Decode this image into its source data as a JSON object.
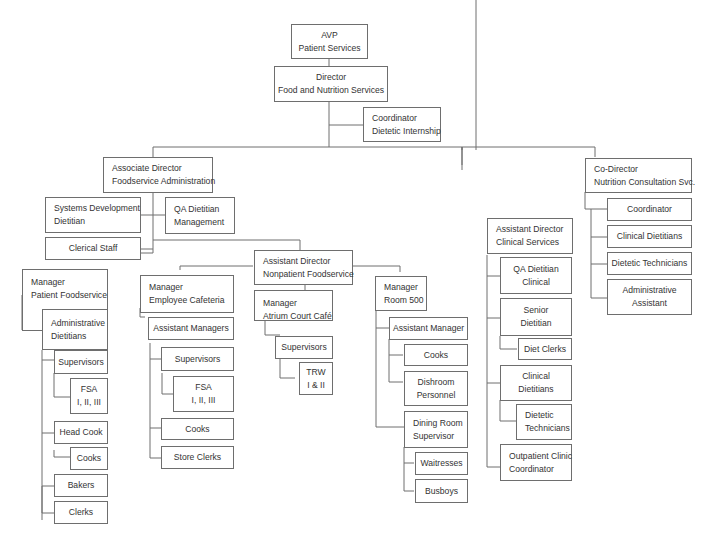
{
  "org_chart": {
    "avp": {
      "line1": "AVP",
      "line2": "Patient Services"
    },
    "director": {
      "line1": "Director",
      "line2": "Food and Nutrition Services"
    },
    "coordinator_internship": {
      "line1": "Coordinator",
      "line2": "Dietetic Internship"
    },
    "assoc_director": {
      "line1": "Associate Director",
      "line2": "Foodservice Administration"
    },
    "systems_dev": {
      "line1": "Systems Development",
      "line2": "Dietitian"
    },
    "qa_mgmt": {
      "line1": "QA Dietitian",
      "line2": "Management"
    },
    "clerical": {
      "line1": "Clerical Staff"
    },
    "mgr_patient": {
      "line1": "Manager",
      "line2": "Patient Foodservice"
    },
    "admin_dietitians": {
      "line1": "Administrative",
      "line2": "Dietitians"
    },
    "pf_supervisors": {
      "line1": "Supervisors"
    },
    "pf_fsa": {
      "line1": "FSA",
      "line2": "I, II, III"
    },
    "pf_head_cook": {
      "line1": "Head Cook"
    },
    "pf_cooks": {
      "line1": "Cooks"
    },
    "pf_bakers": {
      "line1": "Bakers"
    },
    "pf_clerks": {
      "line1": "Clerks"
    },
    "mgr_cafeteria": {
      "line1": "Manager",
      "line2": "Employee Cafeteria"
    },
    "ec_asst_mgrs": {
      "line1": "Assistant Managers"
    },
    "ec_supervisors": {
      "line1": "Supervisors"
    },
    "ec_fsa": {
      "line1": "FSA",
      "line2": "I, II, III"
    },
    "ec_cooks": {
      "line1": "Cooks"
    },
    "ec_store_clerks": {
      "line1": "Store Clerks"
    },
    "asst_dir_nonpatient": {
      "line1": "Assistant Director",
      "line2": "Nonpatient Foodservice"
    },
    "mgr_atrium": {
      "line1": "Manager",
      "line2": "Atrium Court Café"
    },
    "ac_supervisors": {
      "line1": "Supervisors"
    },
    "ac_trw": {
      "line1": "TRW",
      "line2": "I & II"
    },
    "mgr_room500": {
      "line1": "Manager",
      "line2": "Room 500"
    },
    "r5_asst_mgr": {
      "line1": "Assistant Manager"
    },
    "r5_cooks": {
      "line1": "Cooks"
    },
    "r5_dishroom": {
      "line1": "Dishroom",
      "line2": "Personnel"
    },
    "r5_dining_sup": {
      "line1": "Dining Room",
      "line2": "Supervisor"
    },
    "r5_waitresses": {
      "line1": "Waitresses"
    },
    "r5_busboys": {
      "line1": "Busboys"
    },
    "asst_dir_clinical": {
      "line1": "Assistant Director",
      "line2": "Clinical Services"
    },
    "cs_qa_clinical": {
      "line1": "QA Dietitian",
      "line2": "Clinical"
    },
    "cs_senior": {
      "line1": "Senior",
      "line2": "Dietitian"
    },
    "cs_diet_clerks": {
      "line1": "Diet Clerks"
    },
    "cs_clinical_dietitians": {
      "line1": "Clinical",
      "line2": "Dietitians"
    },
    "cs_dietetic_techs": {
      "line1": "Dietetic",
      "line2": "Technicians"
    },
    "cs_outpatient": {
      "line1": "Outpatient Clinic",
      "line2": "Coordinator"
    },
    "co_director": {
      "line1": "Co-Director",
      "line2": "Nutrition Consultation Svc."
    },
    "nc_coordinator": {
      "line1": "Coordinator"
    },
    "nc_clinical_dietitians": {
      "line1": "Clinical Dietitians"
    },
    "nc_dietetic_techs": {
      "line1": "Dietetic Technicians"
    },
    "nc_admin_asst": {
      "line1": "Administrative",
      "line2": "Assistant"
    }
  },
  "colors": {
    "line": "#6e6e6e",
    "box_border": "#6e6e6e",
    "text": "#333333",
    "caption": "#9cc8dc"
  }
}
